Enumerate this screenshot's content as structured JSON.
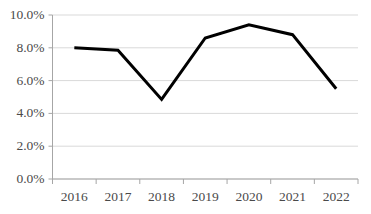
{
  "chart_data": {
    "type": "line",
    "title": "",
    "xlabel": "",
    "ylabel": "",
    "categories": [
      "2016",
      "2017",
      "2018",
      "2019",
      "2020",
      "2021",
      "2022"
    ],
    "values": [
      8.0,
      7.85,
      4.85,
      8.6,
      9.4,
      8.8,
      5.5
    ],
    "value_suffix": "%",
    "series": [
      {
        "name": "",
        "values": [
          8.0,
          7.85,
          4.85,
          8.6,
          9.4,
          8.8,
          5.5
        ],
        "color": "#000000"
      }
    ],
    "ylim": [
      0.0,
      10.0
    ],
    "ytick_values": [
      10.0,
      8.0,
      6.0,
      4.0,
      2.0,
      0.0
    ],
    "ytick_labels": [
      "10.0%",
      "8.0%",
      "6.0%",
      "4.0%",
      "2.0%",
      "0.0%"
    ],
    "xtick_labels": [
      "2016",
      "2017",
      "2018",
      "2019",
      "2020",
      "2021",
      "2022"
    ],
    "grid": true,
    "grid_axis": "y",
    "legend": false,
    "legend_position": "none",
    "colors": {
      "line": "#000000",
      "gridline": "#d9d9d9",
      "axis": "#a6a6a6",
      "tick_text": "#4a4a4a",
      "background": "#ffffff"
    },
    "line_width_px": 3
  },
  "axis_names": {
    "y_axis": "percentage-axis",
    "x_axis": "year-axis"
  }
}
